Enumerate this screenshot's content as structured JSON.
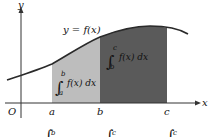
{
  "diagram": {
    "type": "definite-integral-additivity",
    "axes": {
      "y_label": "y",
      "x_label": "x",
      "origin_label": "O"
    },
    "curve_label": "y = f(x)",
    "points": [
      {
        "label": "a"
      },
      {
        "label": "b"
      },
      {
        "label": "c"
      }
    ],
    "regions": [
      {
        "name": "integral-a-to-b",
        "lower": "a",
        "upper": "b",
        "integrand": "f(x) dx",
        "fill": "#bdbdbd"
      },
      {
        "name": "integral-b-to-c",
        "lower": "b",
        "upper": "c",
        "integrand": "f(x) dx",
        "fill": "#5a5a5a"
      }
    ],
    "bottom_partial_formula": {
      "superscripts": [
        "b",
        "c",
        "c"
      ]
    },
    "colors": {
      "curve": "#2a2a2a",
      "axis": "#333333",
      "light_region": "#bdbdbd",
      "dark_region": "#5a5a5a"
    }
  }
}
